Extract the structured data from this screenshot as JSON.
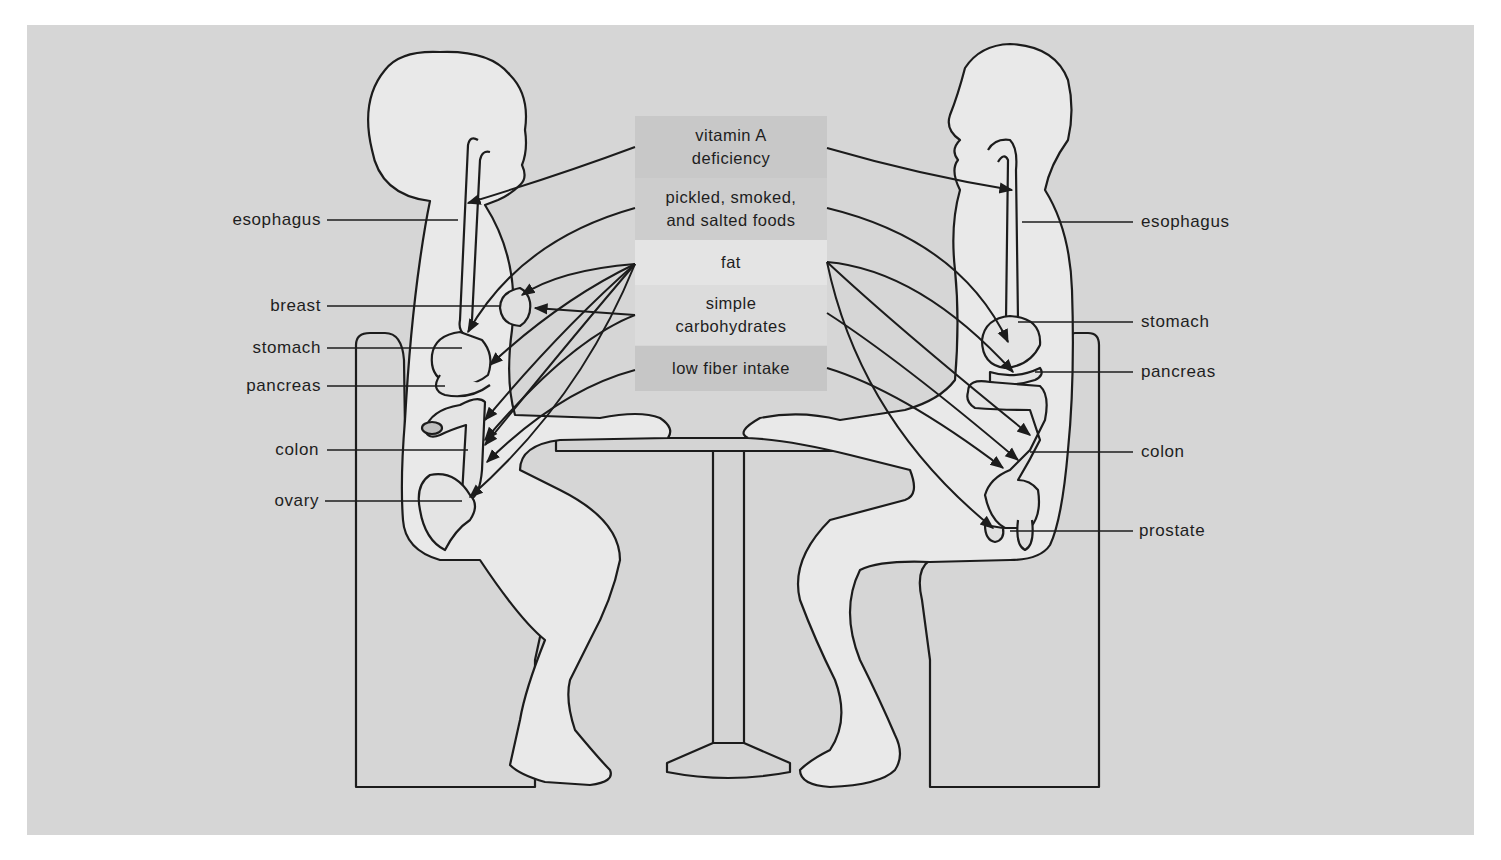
{
  "figure": {
    "background_color": "#d6d6d6",
    "figure_fill": "#e9e9e9",
    "line_color": "#1c1c1c"
  },
  "risk_factors": [
    {
      "label": "vitamin A deficiency",
      "line1": "vitamin A",
      "line2": "deficiency",
      "bg": "#c8c8c8"
    },
    {
      "label": "pickled, smoked, and salted foods",
      "line1": "pickled, smoked,",
      "line2": "and salted foods",
      "bg": "#cdcdcd"
    },
    {
      "label": "fat",
      "line1": "fat",
      "line2": "",
      "bg": "#e4e4e4"
    },
    {
      "label": "simple carbohydrates",
      "line1": "simple",
      "line2": "carbohydrates",
      "bg": "#dcdcdc"
    },
    {
      "label": "low fiber intake",
      "line1": "low fiber intake",
      "line2": "",
      "bg": "#c6c6c6"
    }
  ],
  "female_labels": [
    {
      "text": "esophagus",
      "y": 220
    },
    {
      "text": "breast",
      "y": 306
    },
    {
      "text": "stomach",
      "y": 348
    },
    {
      "text": "pancreas",
      "y": 386
    },
    {
      "text": "colon",
      "y": 450
    },
    {
      "text": "ovary",
      "y": 501
    }
  ],
  "male_labels": [
    {
      "text": "esophagus",
      "y": 222
    },
    {
      "text": "stomach",
      "y": 322
    },
    {
      "text": "pancreas",
      "y": 372
    },
    {
      "text": "colon",
      "y": 452
    },
    {
      "text": "prostate",
      "y": 531
    }
  ]
}
